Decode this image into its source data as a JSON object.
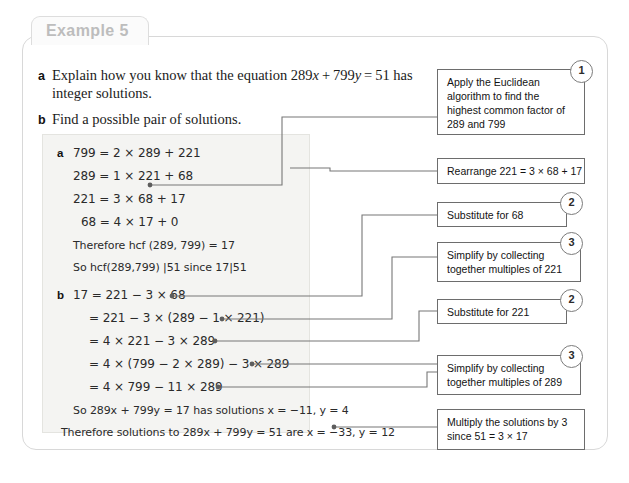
{
  "card": {
    "tab_label": "Example 5"
  },
  "questions": [
    {
      "letter": "a",
      "text": "Explain how you know that the equation 289x + 799y = 51 has integer solutions."
    },
    {
      "letter": "b",
      "text": "Find a possible pair of solutions."
    }
  ],
  "working": {
    "part_a": {
      "letter": "a",
      "lines": [
        "799 = 2 × 289 + 221",
        "289 = 1 × 221 + 68",
        "221 = 3 × 68 + 17",
        "68 = 4 × 17 + 0",
        "Therefore hcf (289, 799) = 17",
        "So hcf(289,799) |51 since 17|51"
      ]
    },
    "part_b": {
      "letter": "b",
      "lines": [
        "17 = 221 − 3 × 68",
        "= 221 − 3 × (289 − 1 × 221)",
        "= 4 × 221 − 3 × 289",
        "= 4 × (799 − 2 × 289) − 3 × 289",
        "= 4 × 799 − 11 × 289",
        "So 289x + 799y = 17 has solutions x = −11,  y = 4",
        "Therefore solutions to 289x + 799y = 51 are x = −33,  y = 12"
      ]
    }
  },
  "notes": [
    {
      "id": "note-euclidean",
      "step": "1",
      "lines": [
        "Apply the Euclidean",
        "algorithm to find the",
        "highest common factor of",
        "289 and 799"
      ]
    },
    {
      "id": "note-rearrange",
      "step": "",
      "lines": [
        "Rearrange 221 = 3 × 68 + 17"
      ]
    },
    {
      "id": "note-substitute-68",
      "step": "2",
      "lines": [
        "Substitute for 68"
      ]
    },
    {
      "id": "note-simplify-221",
      "step": "3",
      "lines": [
        "Simplify by collecting",
        "together multiples of 221"
      ]
    },
    {
      "id": "note-substitute-221",
      "step": "2",
      "lines": [
        "Substitute for 221"
      ]
    },
    {
      "id": "note-simplify-289",
      "step": "3",
      "lines": [
        "Simplify by collecting",
        "together multiples of 289"
      ]
    },
    {
      "id": "note-multiply",
      "step": "",
      "lines": [
        "Multiply the solutions by 3",
        "since 51 = 3 × 17"
      ]
    }
  ],
  "colors": {
    "panel_bg": "#f4f4f2",
    "card_border": "#d8d8d8",
    "note_border": "#6d6d6d",
    "connector": "#777777",
    "tab_text": "#bdbdbd"
  }
}
